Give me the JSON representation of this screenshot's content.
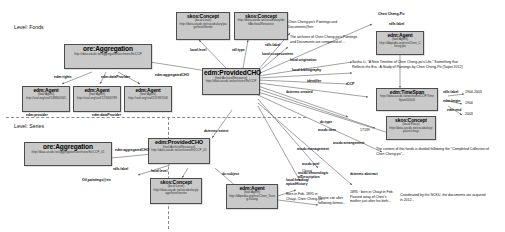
{
  "diagram": {
    "colors": {
      "node_fill": "#c9c9c9",
      "node_border": "#4d4d4d",
      "edge": "#555555",
      "divider": "#8a8a8a",
      "text": "#111111"
    }
  },
  "sections": [
    {
      "id": "fonds",
      "label": "Level: Fonds"
    },
    {
      "id": "series",
      "label": "Level: Series"
    }
  ],
  "nodes": [
    {
      "id": "ore-agg-fonds",
      "title": "ore:Aggregation",
      "uri": "http://data.ascdc.tw/aggregation/archives/ffs/CCP"
    },
    {
      "id": "edm-agent-1",
      "title": "edm:Agent",
      "type": "(foaf:Agent)",
      "uri": "http://viaf.org/viaf/138650345"
    },
    {
      "id": "edm-agent-2",
      "title": "edm:Agent",
      "type": "(foaf:Agent)",
      "uri": "http://viaf.org/viaf/123456789"
    },
    {
      "id": "edm-agent-3",
      "title": "edm:Agent",
      "type": "(foaf:Agent)",
      "uri": "http://viaf.org/viaf/211987006"
    },
    {
      "id": "skos-concept-level-top",
      "title": "skos:Concept",
      "type": "(local:Level)",
      "uri": "http://data.ascdc.tw/vocabulary/page/level/fonds"
    },
    {
      "id": "skos-concept-type-top",
      "title": "skos:Concept",
      "type": "",
      "uri": "http://data.ascdc.tw/vocabulary/def/ArchivalResource"
    },
    {
      "id": "edm-providedcho-fonds",
      "title": "edm:ProvidedCHO",
      "type": "(foaf:ArchivalResource)",
      "uri": "http://data.ascdc.tw/archives/ffs/CCP"
    },
    {
      "id": "edm-agent-chen",
      "title": "edm:Agent",
      "type": "(foaf:Agent)",
      "uri": "http://dbpedia.org/res/Chen_Cheng-po"
    },
    {
      "id": "edm-timespan",
      "title": "edm:TimeSpan",
      "type": "",
      "uri": "http://data.ascdc.tw/archives/CCP/TimeSpan/00001"
    },
    {
      "id": "skos-concept-place",
      "title": "skos:Concept",
      "type": "(local:Place)",
      "uri": "http://data.ascdc.tw/vocabulary/place/chiayi"
    },
    {
      "id": "ore-agg-series",
      "title": "ore:Aggregation",
      "uri": "http://data.ascdc.tw/aggregation/archives/ffs/CCP_01"
    },
    {
      "id": "edm-providedcho-series",
      "title": "edm:ProvidedCHO",
      "type": "(foaf:ArchivalResource)",
      "uri": "http://data.ascdc.tw/archives/ffs/CCP_01"
    },
    {
      "id": "skos-concept-level-series",
      "title": "skos:Concept",
      "type": "(local:Level)",
      "uri": "http://data.ascdc.tw/vocabulary/page/level/series"
    },
    {
      "id": "edm-agent-bottom",
      "title": "edm:Agent",
      "type": "(foaf:Agent)",
      "uri": "http://dbpedia.org/res/Chen_Tsung-Kuang"
    }
  ],
  "edge_labels": [
    {
      "id": "e-edm-rights",
      "text": "edm:rights"
    },
    {
      "id": "e-edm-dataprovider",
      "text": "edm:dataProvider"
    },
    {
      "id": "e-edm-aggcho-1",
      "text": "edm:aggregatedCHO"
    },
    {
      "id": "e-local-level-top",
      "text": "local:level"
    },
    {
      "id": "e-rdf-type-top",
      "text": "rdf:type"
    },
    {
      "id": "e-rdfs-label-top",
      "text": "rdfs:label"
    },
    {
      "id": "e-local-scope",
      "text": "local:scopecontent"
    },
    {
      "id": "e-local-orig",
      "text": "local:origination"
    },
    {
      "id": "e-local-biblio",
      "text": "local:bibliography"
    },
    {
      "id": "e-identifier",
      "text": "identifier"
    },
    {
      "id": "e-rdfs-label-agent",
      "text": "rdfs:label"
    },
    {
      "id": "e-rdfs-label-ts",
      "text": "rdfs:label"
    },
    {
      "id": "e-edm-begin",
      "text": "edm:begin"
    },
    {
      "id": "e-edm-end",
      "text": "edm:end"
    },
    {
      "id": "e-dcterms-created",
      "text": "dcterms:created"
    },
    {
      "id": "e-dc-type",
      "text": "dc:type"
    },
    {
      "id": "e-ascdc-item",
      "text": "ascdc:item"
    },
    {
      "id": "e-ascdc-arrange",
      "text": "ascdc:arrangement"
    },
    {
      "id": "e-ascdc-pref",
      "text": "ascdc:pref"
    },
    {
      "id": "e-ascdc-mgmt",
      "text": "ascdc:management"
    },
    {
      "id": "e-ascdc-chrono",
      "text": "ascdc:chronologic\nalDescription"
    },
    {
      "id": "e-dcterms-abstract",
      "text": "dcterms:abstract"
    },
    {
      "id": "e-dc-subject",
      "text": "dc:subject"
    },
    {
      "id": "e-local-heading",
      "text": "local:heading/\napicalHistory"
    },
    {
      "id": "e-dcterms-extent",
      "text": "dcterms:extent"
    },
    {
      "id": "e-edm-aggcho-2",
      "text": "edm:aggregatedCHO"
    },
    {
      "id": "e-rdfs-label-oil",
      "text": "rdfs:label"
    },
    {
      "id": "e-local-level-ser",
      "text": "local:level"
    },
    {
      "id": "e-edm-dataprov-2",
      "text": "edm:dataProvider"
    },
    {
      "id": "e-edm-provider",
      "text": "edm:provider"
    }
  ],
  "literals": [
    {
      "id": "lit-title-en",
      "text": "Chen Cheng-po's Paintings and Documents@en"
    },
    {
      "id": "lit-scope",
      "text": "The archives of Chen Cheng-po's Paintings and Documents are composed of ..."
    },
    {
      "id": "lit-agentname",
      "text": "Chen Cheng-Po"
    },
    {
      "id": "lit-biblio",
      "text": "Sasha Li, \"A New Timeline of Chen Cheng-po's Life,\" Something that Reflects the Era - A Study of Paintings by Chen Cheng-Po (Taipei 2012)"
    },
    {
      "id": "lit-ccp",
      "text": "CCP"
    },
    {
      "id": "lit-span",
      "text": "1904-2003"
    },
    {
      "id": "lit-begin",
      "text": "1904"
    },
    {
      "id": "lit-end",
      "text": "2003"
    },
    {
      "id": "lit-item",
      "text": "17139"
    },
    {
      "id": "lit-chiayi",
      "text": "Chiayi"
    },
    {
      "id": "lit-arrange",
      "text": "The content of this fonds is divided following the \"Completed Collection of Chen Cheng-po\"..."
    },
    {
      "id": "lit-mgmt",
      "text": "Coordinated by the NCKU, the documents are acquired in 2012..."
    },
    {
      "id": "lit-chrono",
      "text": "1895 : born in Chiayi in Feb. Passed away of Chen's mother just after his birth..."
    },
    {
      "id": "lit-heading",
      "text": "Born in Feb. 1895 in Chiayi, Chen Cheng-po..."
    },
    {
      "id": "lit-cite",
      "text": "Please cite after following format..."
    },
    {
      "id": "lit-oil",
      "text": "Oil paintings@en"
    }
  ]
}
